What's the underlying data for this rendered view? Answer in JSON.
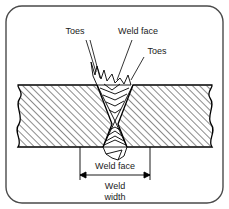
{
  "figure": {
    "border": {
      "shape": "rounded-rectangle",
      "color": "#4a4a4a"
    },
    "colors": {
      "line": "#000000",
      "border": "#4a4a4a",
      "hatch": "#2b2b2b",
      "fill": "#ffffff",
      "text": "#1a1a1a"
    },
    "labels": {
      "toes_left": "Toes",
      "weld_face_top": "Weld face",
      "toes_right": "Toes",
      "weld_face_bottom": "Weld face",
      "weld_width_line1": "Weld",
      "weld_width_line2": "width"
    },
    "parts": {
      "left_plate": "left base metal plate",
      "right_plate": "right base metal plate",
      "upper_bead": "upper weld reinforcement",
      "lower_bead": "lower weld reinforcement",
      "dimension": "weld width dimension line"
    }
  }
}
